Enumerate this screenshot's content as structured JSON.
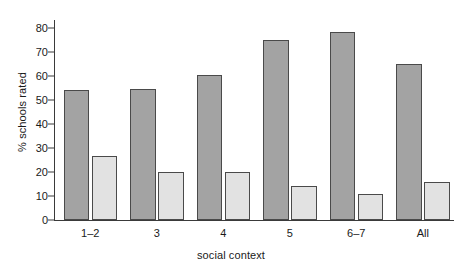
{
  "chart_data": {
    "type": "bar",
    "title": "",
    "subtitle": "",
    "xlabel": "social context",
    "ylabel": "% schools rated",
    "categories": [
      "1–2",
      "3",
      "4",
      "5",
      "6–7",
      "All"
    ],
    "series": [
      {
        "name": "dark-series",
        "color": "#a3a3a3",
        "values": [
          54,
          54.5,
          60.5,
          75,
          78.5,
          65
        ]
      },
      {
        "name": "light-series",
        "color": "#e2e2e2",
        "values": [
          26.5,
          20,
          20,
          14,
          11,
          16
        ]
      }
    ],
    "ylim": [
      0,
      80
    ],
    "yticks": [
      0,
      10,
      20,
      30,
      40,
      50,
      60,
      70,
      80
    ],
    "ytick_labels": [
      "0",
      "10",
      "20",
      "30",
      "40",
      "50",
      "60",
      "70",
      "80"
    ],
    "grid": false,
    "legend": "none",
    "axis_color": "#3a3a3a",
    "bar_edge_color": "#4a4a4a",
    "background": "#ffffff"
  }
}
